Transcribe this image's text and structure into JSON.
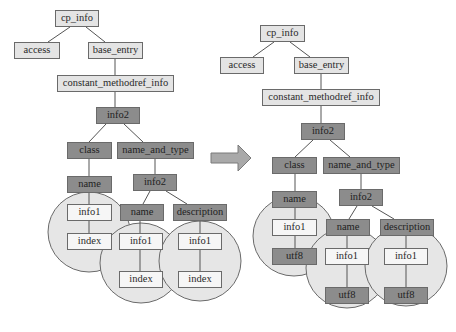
{
  "diagram": {
    "type": "tree-transformation",
    "arrow": {
      "direction": "right",
      "color": "#a9a9a9"
    },
    "colors": {
      "light_node": "#e4e4e4",
      "dark_node": "#8c8c8c",
      "white_node": "#f6f6f6",
      "circle": "#e6e6e6",
      "line": "#555555"
    },
    "left_tree": {
      "cp_info": "cp_info",
      "access": "access",
      "base_entry": "base_entry",
      "constant_methodref_info": "constant_methodref_info",
      "info2": "info2",
      "class": "class",
      "name_and_type": "name_and_type",
      "class_name": "name",
      "nat_info2": "info2",
      "nat_name": "name",
      "nat_description": "description",
      "class_info1": "info1",
      "class_index": "index",
      "name_info1": "info1",
      "name_index": "index",
      "desc_info1": "info1",
      "desc_index": "index"
    },
    "right_tree": {
      "cp_info": "cp_info",
      "access": "access",
      "base_entry": "base_entry",
      "constant_methodref_info": "constant_methodref_info",
      "info2": "info2",
      "class": "class",
      "name_and_type": "name_and_type",
      "class_name": "name",
      "nat_info2": "info2",
      "nat_name": "name",
      "nat_description": "description",
      "class_info1": "info1",
      "class_utf8": "utf8",
      "name_info1": "info1",
      "name_utf8": "utf8",
      "desc_info1": "info1",
      "desc_utf8": "utf8"
    }
  }
}
